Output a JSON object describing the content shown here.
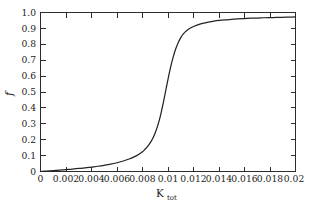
{
  "figure": {
    "background_color": "#ffffff",
    "frame_color": "#2b2b2b",
    "curve_color": "#232323"
  },
  "chart_data": {
    "type": "line",
    "title": "",
    "subtitle": "",
    "xlabel": "K_tot",
    "xlabel_base": "K",
    "xlabel_subscript": "tot",
    "ylabel": "f",
    "xlim": [
      0,
      0.02
    ],
    "ylim": [
      0,
      1.0
    ],
    "grid": false,
    "legend": null,
    "legend_position": "none",
    "xticks": [
      0,
      0.002,
      0.004,
      0.006,
      0.008,
      0.01,
      0.012,
      0.014,
      0.016,
      0.018,
      0.02
    ],
    "xtick_labels": [
      "0",
      "0.002",
      "0.004",
      "0.006",
      "0.008",
      "0.01",
      "0.012",
      "0.014",
      "0.016",
      "0.018",
      "0.02"
    ],
    "yticks": [
      0,
      0.1,
      0.2,
      0.3,
      0.4,
      0.5,
      0.6,
      0.7,
      0.8,
      0.9,
      1.0
    ],
    "ytick_labels": [
      "0",
      "0.1",
      "0.2",
      "0.3",
      "0.4",
      "0.5",
      "0.6",
      "0.7",
      "0.8",
      "0.9",
      "1.0"
    ],
    "tick_direction": "in",
    "ticks_on_all_sides": true,
    "series": [
      {
        "name": "f",
        "x": [
          0,
          0.0005,
          0.001,
          0.0015,
          0.002,
          0.0025,
          0.003,
          0.0035,
          0.004,
          0.0045,
          0.005,
          0.0055,
          0.006,
          0.0065,
          0.007,
          0.0075,
          0.008,
          0.0082,
          0.0084,
          0.0086,
          0.0088,
          0.009,
          0.0092,
          0.0094,
          0.0096,
          0.0098,
          0.01,
          0.0102,
          0.0104,
          0.0106,
          0.0108,
          0.011,
          0.0112,
          0.0115,
          0.012,
          0.0125,
          0.013,
          0.0135,
          0.014,
          0.0145,
          0.015,
          0.0155,
          0.016,
          0.0165,
          0.017,
          0.0175,
          0.018,
          0.0185,
          0.019,
          0.0195,
          0.02
        ],
        "y": [
          0.0,
          0.003,
          0.006,
          0.009,
          0.012,
          0.015,
          0.019,
          0.023,
          0.028,
          0.033,
          0.039,
          0.046,
          0.055,
          0.066,
          0.08,
          0.098,
          0.125,
          0.14,
          0.158,
          0.18,
          0.208,
          0.244,
          0.29,
          0.348,
          0.42,
          0.5,
          0.58,
          0.655,
          0.718,
          0.77,
          0.81,
          0.842,
          0.866,
          0.889,
          0.912,
          0.927,
          0.937,
          0.944,
          0.95,
          0.954,
          0.957,
          0.96,
          0.962,
          0.964,
          0.965,
          0.967,
          0.968,
          0.969,
          0.97,
          0.971,
          0.972
        ]
      }
    ],
    "annotations": []
  }
}
